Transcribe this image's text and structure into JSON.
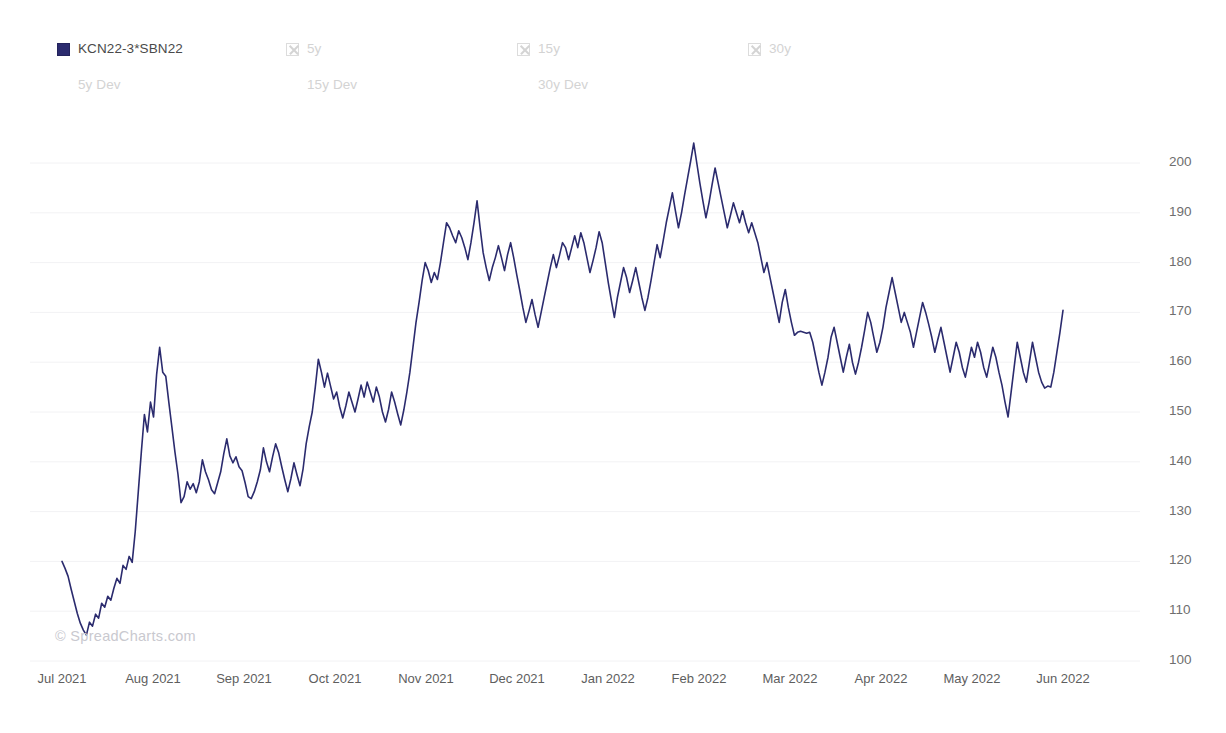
{
  "legend": {
    "primary": [
      {
        "label": "KCN22-3*SBN22",
        "icon": "filled-square-swatch",
        "state": "active",
        "x": 57
      },
      {
        "label": "5y",
        "icon": "x-checkbox-icon",
        "state": "inactive",
        "x": 286
      },
      {
        "label": "15y",
        "icon": "x-checkbox-icon",
        "state": "inactive",
        "x": 517
      },
      {
        "label": "30y",
        "icon": "x-checkbox-icon",
        "state": "inactive",
        "x": 748
      }
    ],
    "secondary": [
      {
        "label": "5y Dev",
        "state": "inactive",
        "x": 57
      },
      {
        "label": "15y Dev",
        "state": "inactive",
        "x": 286
      },
      {
        "label": "30y Dev",
        "state": "inactive",
        "x": 517
      }
    ]
  },
  "watermark": "© SpreadCharts.com",
  "chart_data": {
    "type": "line",
    "title": "",
    "subtitle": "",
    "xlabel": "",
    "ylabel": "",
    "grid": true,
    "legend_position": "top-left",
    "line_color": "#2b2b6e",
    "line_width": 1.6,
    "background": "#ffffff",
    "ylim": [
      100,
      205
    ],
    "yticks": [
      100,
      110,
      120,
      130,
      140,
      150,
      160,
      170,
      180,
      190,
      200
    ],
    "ytick_labels": [
      "100",
      "110",
      "120",
      "130",
      "140",
      "150",
      "160",
      "170",
      "180",
      "190",
      "200"
    ],
    "xticks": [
      0,
      1,
      2,
      3,
      4,
      5,
      6,
      7,
      8,
      9,
      10,
      11
    ],
    "xtick_labels": [
      "Jul 2021",
      "Aug 2021",
      "Sep 2021",
      "Oct 2021",
      "Nov 2021",
      "Dec 2021",
      "Jan 2022",
      "Feb 2022",
      "Mar 2022",
      "Apr 2022",
      "May 2022",
      "Jun 2022"
    ],
    "xlim_months": [
      0,
      11
    ],
    "series": [
      {
        "name": "KCN22-3*SBN22",
        "color": "#2b2b6e",
        "values": [
          120.0,
          118.6,
          117.0,
          114.4,
          112.0,
          109.6,
          107.6,
          106.2,
          105.2,
          107.8,
          107.0,
          109.4,
          108.6,
          111.6,
          110.8,
          113.0,
          112.2,
          114.6,
          116.6,
          115.6,
          119.2,
          118.4,
          121.0,
          119.8,
          126.0,
          134.0,
          142.0,
          149.5,
          146.0,
          152.0,
          149.0,
          157.5,
          163.0,
          158.0,
          157.2,
          152.0,
          147.0,
          142.0,
          137.5,
          131.8,
          133.0,
          136.0,
          134.5,
          135.6,
          133.8,
          136.0,
          140.4,
          138.0,
          136.4,
          134.4,
          133.6,
          135.8,
          138.0,
          141.6,
          144.6,
          141.2,
          139.8,
          141.0,
          139.0,
          138.2,
          135.8,
          133.0,
          132.6,
          134.0,
          136.0,
          138.4,
          142.8,
          140.0,
          138.0,
          141.0,
          143.6,
          141.8,
          139.0,
          136.4,
          134.0,
          136.6,
          139.8,
          137.4,
          135.2,
          138.6,
          143.6,
          147.0,
          150.0,
          155.0,
          160.6,
          158.0,
          155.0,
          157.8,
          155.2,
          152.6,
          154.0,
          151.0,
          148.8,
          151.2,
          154.0,
          152.0,
          150.0,
          152.6,
          155.4,
          153.0,
          156.0,
          154.0,
          152.0,
          155.0,
          153.0,
          150.0,
          148.0,
          150.5,
          154.0,
          152.0,
          149.6,
          147.4,
          150.4,
          154.0,
          158.0,
          163.0,
          168.0,
          172.0,
          176.4,
          180.0,
          178.4,
          176.0,
          178.0,
          176.6,
          180.0,
          184.0,
          188.0,
          187.0,
          185.4,
          184.0,
          186.4,
          185.0,
          183.0,
          180.6,
          184.0,
          188.0,
          192.4,
          187.0,
          182.0,
          179.0,
          176.4,
          179.0,
          181.0,
          183.4,
          181.0,
          178.4,
          181.6,
          184.0,
          181.0,
          177.6,
          174.4,
          171.0,
          168.0,
          170.2,
          172.6,
          169.6,
          167.0,
          170.0,
          173.0,
          176.0,
          179.0,
          181.6,
          179.0,
          181.4,
          184.0,
          183.0,
          180.6,
          183.0,
          185.4,
          183.0,
          186.0,
          184.0,
          181.0,
          178.0,
          180.4,
          183.0,
          186.2,
          184.0,
          180.0,
          176.0,
          172.4,
          169.0,
          173.0,
          176.0,
          179.0,
          177.0,
          174.0,
          176.4,
          179.0,
          176.0,
          173.0,
          170.4,
          173.0,
          176.4,
          180.0,
          183.6,
          181.0,
          184.4,
          188.0,
          191.0,
          194.0,
          190.4,
          187.0,
          190.0,
          193.6,
          197.0,
          200.4,
          204.0,
          200.0,
          196.0,
          192.4,
          189.0,
          192.0,
          195.6,
          199.0,
          196.0,
          193.0,
          190.0,
          187.0,
          189.4,
          192.0,
          190.0,
          188.0,
          190.4,
          188.0,
          186.0,
          188.0,
          186.0,
          184.0,
          181.0,
          178.0,
          180.0,
          177.0,
          174.0,
          171.0,
          168.0,
          172.0,
          174.6,
          171.0,
          168.0,
          165.4,
          166.0,
          166.2,
          166.0,
          165.8,
          166.0,
          164.0,
          161.0,
          158.0,
          155.4,
          158.0,
          161.0,
          165.0,
          167.0,
          164.0,
          161.0,
          158.0,
          161.0,
          163.6,
          160.0,
          157.6,
          160.0,
          163.0,
          166.4,
          170.0,
          168.0,
          165.0,
          162.0,
          164.0,
          167.0,
          171.0,
          174.0,
          177.0,
          174.0,
          171.0,
          168.0,
          170.0,
          168.0,
          166.0,
          163.0,
          166.0,
          169.0,
          172.0,
          170.0,
          167.6,
          165.0,
          162.0,
          164.6,
          167.0,
          164.0,
          161.0,
          158.0,
          161.0,
          164.0,
          162.0,
          159.0,
          157.0,
          160.0,
          163.0,
          161.0,
          164.0,
          162.0,
          159.0,
          157.0,
          160.0,
          163.0,
          161.0,
          158.0,
          155.4,
          152.0,
          149.0,
          154.0,
          159.0,
          164.0,
          161.0,
          158.0,
          156.0,
          160.0,
          164.0,
          161.0,
          158.0,
          156.0,
          154.8,
          155.2,
          155.0,
          158.0,
          162.0,
          166.0,
          170.4
        ]
      }
    ]
  }
}
